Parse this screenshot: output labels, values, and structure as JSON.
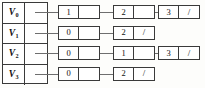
{
  "diagram": {
    "null_marker": "/",
    "colors": {
      "border": "#3a3a3a",
      "connector": "#6e6e6e",
      "background": "#fdfdfb",
      "cell_fill": "#ffffff",
      "text": "#111111"
    },
    "vertices": [
      {
        "label": "V",
        "index": "0"
      },
      {
        "label": "V",
        "index": "1"
      },
      {
        "label": "V",
        "index": "2"
      },
      {
        "label": "V",
        "index": "3"
      }
    ],
    "rows": [
      {
        "vertex": "V0",
        "nodes": [
          {
            "data": "1",
            "link": ""
          },
          {
            "data": "2",
            "link": ""
          },
          {
            "data": "3",
            "link": "/"
          }
        ]
      },
      {
        "vertex": "V1",
        "nodes": [
          {
            "data": "0",
            "link": ""
          },
          {
            "data": "2",
            "link": "/"
          }
        ]
      },
      {
        "vertex": "V2",
        "nodes": [
          {
            "data": "0",
            "link": ""
          },
          {
            "data": "1",
            "link": ""
          },
          {
            "data": "3",
            "link": "/"
          }
        ]
      },
      {
        "vertex": "V3",
        "nodes": [
          {
            "data": "0",
            "link": ""
          },
          {
            "data": "2",
            "link": "/"
          }
        ]
      }
    ]
  }
}
